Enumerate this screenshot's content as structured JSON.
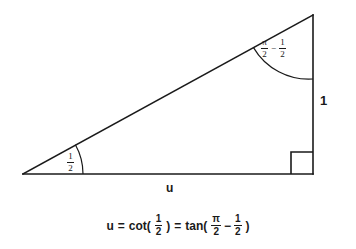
{
  "figure": {
    "type": "right-triangle-trig-diagram",
    "background_color": "#ffffff",
    "stroke_color": "#1a1a1a",
    "vertices": {
      "left": [
        23,
        174
      ],
      "bottom_right": [
        313,
        174
      ],
      "top_right": [
        313,
        15
      ]
    },
    "right_angle_corner": "bottom-right",
    "labels": {
      "angle_top": {
        "pi": "π",
        "num_a": "2",
        "minus": "−",
        "num_b": "1",
        "den_b": "2",
        "plain": "π/2 − 1/2"
      },
      "angle_left": {
        "num": "1",
        "den": "2",
        "plain": "1/2"
      },
      "side_right": "1",
      "side_base": "u"
    }
  },
  "equation": {
    "u": "u",
    "eq1": "=",
    "cot": "cot(",
    "cot_num": "1",
    "cot_den": "2",
    "cot_close": ")",
    "eq2": "=",
    "tan": "tan(",
    "pi": "π",
    "pi_den": "2",
    "minus": "−",
    "half_num": "1",
    "half_den": "2",
    "tan_close": ")",
    "plain": "u = cot( 1/2 ) = tan( π/2 − 1/2 )"
  }
}
